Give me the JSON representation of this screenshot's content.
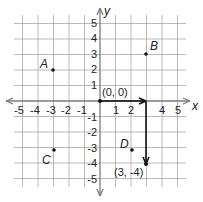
{
  "diagram": {
    "type": "coordinate-plane",
    "x_axis": {
      "label": "x",
      "min": -5,
      "max": 5,
      "ticks": [
        "-5",
        "-4",
        "-3",
        "-2",
        "-1",
        "1",
        "2",
        "4",
        "5"
      ]
    },
    "y_axis": {
      "label": "y",
      "min": -5,
      "max": 5,
      "ticks": [
        "5",
        "4",
        "3",
        "2",
        "1",
        "-1",
        "-2",
        "-3",
        "-4",
        "-5"
      ]
    },
    "origin_label": "(0, 0)",
    "points": [
      {
        "name": "A",
        "x": -3,
        "y": 2
      },
      {
        "name": "B",
        "x": 3,
        "y": 3
      },
      {
        "name": "C",
        "x": -3,
        "y": -3
      },
      {
        "name": "D",
        "x": 2,
        "y": -3
      }
    ],
    "path": {
      "description": "Move 3 right then 4 down from origin",
      "from": [
        0,
        0
      ],
      "via": [
        3,
        0
      ],
      "to": [
        3,
        -4
      ],
      "end_label": "(3, -4)"
    },
    "colors": {
      "grid": "#9a9a9a",
      "axis": "#7a7a7a",
      "path": "#111111",
      "text": "#222222"
    }
  }
}
